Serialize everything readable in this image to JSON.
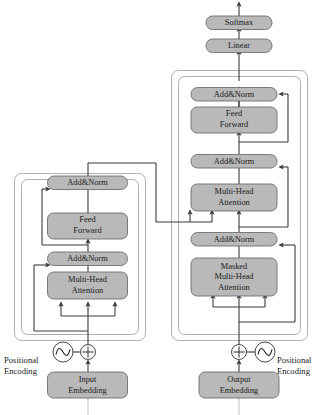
{
  "diagram": {
    "canvas": {
      "width": 326,
      "height": 415
    },
    "style": {
      "box_fill": "#b9b9b9",
      "box_stroke": "#6e6e6e",
      "container_stroke": "#b0b0b0",
      "line_color": "#3a3a3a",
      "faded_line_color": "#c9c9c9",
      "background": "#ffffff",
      "text_color": "#1a1a1a"
    },
    "encoder": {
      "name": "encoder-stack",
      "blocks": [
        {
          "id": "enc-add-norm-2",
          "label": "Add&Norm",
          "lines": [
            "Add&Norm"
          ]
        },
        {
          "id": "enc-feed-forward",
          "label": "Feed Forward",
          "lines": [
            "Feed",
            "Forward"
          ]
        },
        {
          "id": "enc-add-norm-1",
          "label": "Add&Norm",
          "lines": [
            "Add&Norm"
          ]
        },
        {
          "id": "enc-multi-head-attention",
          "label": "Multi-Head Attention",
          "lines": [
            "Multi-Head",
            "Attention"
          ]
        }
      ],
      "embedding": {
        "id": "input-embedding",
        "label": "Input Embedding",
        "lines": [
          "Input",
          "Embedding"
        ]
      },
      "positional_encoding": {
        "id": "enc-positional-encoding",
        "lines": [
          "Positional",
          "Encoding"
        ]
      },
      "add_symbol": "⊕",
      "wave_symbol": "sine-wave"
    },
    "decoder": {
      "name": "decoder-stack",
      "blocks": [
        {
          "id": "dec-add-norm-3",
          "label": "Add&Norm",
          "lines": [
            "Add&Norm"
          ]
        },
        {
          "id": "dec-feed-forward",
          "label": "Feed Forward",
          "lines": [
            "Feed",
            "Forward"
          ]
        },
        {
          "id": "dec-add-norm-2",
          "label": "Add&Norm",
          "lines": [
            "Add&Norm"
          ]
        },
        {
          "id": "dec-multi-head-attention",
          "label": "Multi-Head Attention",
          "lines": [
            "Multi-Head",
            "Attention"
          ]
        },
        {
          "id": "dec-add-norm-1",
          "label": "Add&Norm",
          "lines": [
            "Add&Norm"
          ]
        },
        {
          "id": "dec-masked-multi-head-attention",
          "label": "Masked Multi-Head Attention",
          "lines": [
            "Masked",
            "Multi-Head",
            "Attention"
          ]
        }
      ],
      "embedding": {
        "id": "output-embedding",
        "label": "Output Embedding",
        "lines": [
          "Output",
          "Embedding"
        ]
      },
      "positional_encoding": {
        "id": "dec-positional-encoding",
        "lines": [
          "Positional",
          "Encoding"
        ]
      },
      "add_symbol": "⊕",
      "wave_symbol": "sine-wave"
    },
    "head": {
      "linear": {
        "id": "linear",
        "label": "Linear",
        "lines": [
          "Linear"
        ]
      },
      "softmax": {
        "id": "softmax",
        "label": "Softmax",
        "lines": [
          "Softmax"
        ]
      }
    },
    "labels": {
      "add_norm": "Add&Norm",
      "feed_forward_l1": "Feed",
      "feed_forward_l2": "Forward",
      "multi_head_l1": "Multi-Head",
      "multi_head_l2": "Attention",
      "masked_l1": "Masked",
      "masked_l2": "Multi-Head",
      "masked_l3": "Attention",
      "input_embedding_l1": "Input",
      "input_embedding_l2": "Embedding",
      "output_embedding_l1": "Output",
      "output_embedding_l2": "Embedding",
      "linear": "Linear",
      "softmax": "Softmax",
      "positional_l1": "Positional",
      "positional_l2": "Encoding"
    }
  }
}
